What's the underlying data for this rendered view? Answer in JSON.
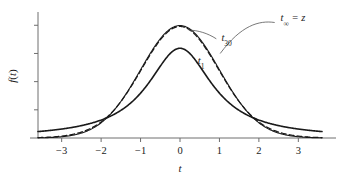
{
  "chart_data": {
    "type": "line",
    "title": "",
    "xlabel": "t",
    "ylabel": "f(t)",
    "xlim": [
      -3.6,
      3.6
    ],
    "ylim": [
      0,
      0.44
    ],
    "xticks": [
      -3,
      -2,
      -1,
      0,
      1,
      2,
      3
    ],
    "xtick_labels": [
      "−3",
      "−2",
      "−1",
      "0",
      "1",
      "2",
      "3"
    ],
    "yticks": [
      0.1,
      0.2,
      0.3,
      0.4
    ],
    "ytick_labels": [
      "",
      "",
      "",
      ""
    ],
    "grid": false,
    "legend_position": "inline-annotations",
    "x": [
      -3.6,
      -3.4,
      -3.2,
      -3.0,
      -2.8,
      -2.6,
      -2.4,
      -2.2,
      -2.0,
      -1.8,
      -1.6,
      -1.4,
      -1.2,
      -1.0,
      -0.8,
      -0.6,
      -0.4,
      -0.2,
      0.0,
      0.2,
      0.4,
      0.6,
      0.8,
      1.0,
      1.2,
      1.4,
      1.6,
      1.8,
      2.0,
      2.2,
      2.4,
      2.6,
      2.8,
      3.0,
      3.2,
      3.4,
      3.6
    ],
    "series": [
      {
        "name": "t₁",
        "label": "t",
        "subscript": "1",
        "style": "solid",
        "width": 1.6,
        "color": "#1a1a1a",
        "peak": 0.3183,
        "values": [
          0.024,
          0.0268,
          0.0301,
          0.0318,
          0.0376,
          0.0424,
          0.0483,
          0.0557,
          0.0637,
          0.0746,
          0.0894,
          0.1074,
          0.1304,
          0.1592,
          0.1941,
          0.234,
          0.2743,
          0.306,
          0.3183,
          0.306,
          0.2743,
          0.234,
          0.1941,
          0.1592,
          0.1304,
          0.1074,
          0.0894,
          0.0746,
          0.0637,
          0.0557,
          0.0483,
          0.0424,
          0.0376,
          0.0318,
          0.0301,
          0.0268,
          0.024
        ]
      },
      {
        "name": "t₃₀",
        "label": "t",
        "subscript": "30",
        "style": "dashed",
        "width": 1.2,
        "color": "#1a1a1a",
        "peak": 0.3958,
        "values": [
          0.0008,
          0.0013,
          0.0021,
          0.0033,
          0.0052,
          0.008,
          0.012,
          0.0178,
          0.0257,
          0.0365,
          0.0506,
          0.0686,
          0.0906,
          0.1163,
          0.145,
          0.1752,
          0.205,
          0.2303,
          0.3958,
          0.2303,
          0.205,
          0.1752,
          0.145,
          0.1163,
          0.0906,
          0.0686,
          0.0506,
          0.0365,
          0.0257,
          0.0178,
          0.012,
          0.008,
          0.0052,
          0.0033,
          0.0021,
          0.0013,
          0.0008
        ]
      },
      {
        "name": "t∞ = z",
        "label": "t",
        "subscript": "∞",
        "suffix": " = z",
        "style": "solid",
        "width": 1.1,
        "color": "#1a1a1a",
        "peak": 0.3989,
        "values": [
          0.0006,
          0.0012,
          0.0024,
          0.0044,
          0.0079,
          0.0136,
          0.0224,
          0.0355,
          0.054,
          0.079,
          0.1109,
          0.1497,
          0.1942,
          0.242,
          0.2897,
          0.3332,
          0.3683,
          0.391,
          0.3989,
          0.391,
          0.3683,
          0.3332,
          0.2897,
          0.242,
          0.1942,
          0.1497,
          0.1109,
          0.079,
          0.054,
          0.0355,
          0.0224,
          0.0136,
          0.0079,
          0.0044,
          0.0024,
          0.0012,
          0.0006
        ]
      }
    ],
    "annotations": [
      {
        "id": "t-inf",
        "text": "t∞ = z",
        "x": 2.55,
        "y": 0.415
      },
      {
        "id": "t-30",
        "text": "t₃₀",
        "x": 1.05,
        "y": 0.345
      },
      {
        "id": "t-1",
        "text": "t₁",
        "x": 0.45,
        "y": 0.262
      }
    ]
  }
}
